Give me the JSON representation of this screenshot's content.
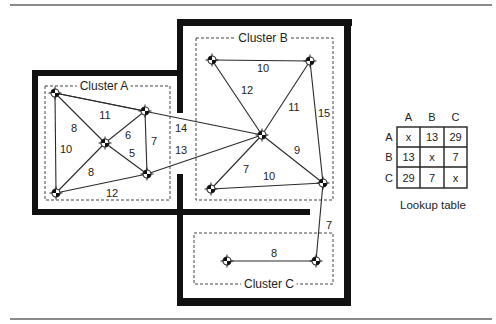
{
  "clusters": [
    {
      "id": "A",
      "label": "Cluster A"
    },
    {
      "id": "B",
      "label": "Cluster B"
    },
    {
      "id": "C",
      "label": "Cluster C"
    }
  ],
  "nodes": [
    "A1",
    "A2",
    "A3",
    "A4",
    "A5",
    "B1",
    "B2",
    "B3",
    "B4",
    "B5",
    "C1",
    "C2"
  ],
  "edges": [
    {
      "from": "A1",
      "to": "A2",
      "weight": "8"
    },
    {
      "from": "A1",
      "to": "A3",
      "weight": "11"
    },
    {
      "from": "A1",
      "to": "A4",
      "weight": "10"
    },
    {
      "from": "A2",
      "to": "A3",
      "weight": "6"
    },
    {
      "from": "A2",
      "to": "A5",
      "weight": "5"
    },
    {
      "from": "A2",
      "to": "A4",
      "weight": "8"
    },
    {
      "from": "A3",
      "to": "A5",
      "weight": "7"
    },
    {
      "from": "A4",
      "to": "A5",
      "weight": "12"
    },
    {
      "from": "A1",
      "to": "B3",
      "weight": "14"
    },
    {
      "from": "A5",
      "to": "B3",
      "weight": "13"
    },
    {
      "from": "B1",
      "to": "B2",
      "weight": "10"
    },
    {
      "from": "B1",
      "to": "B3",
      "weight": "12"
    },
    {
      "from": "B2",
      "to": "B3",
      "weight": "11"
    },
    {
      "from": "B2",
      "to": "B5",
      "weight": "15"
    },
    {
      "from": "B3",
      "to": "B5",
      "weight": "9"
    },
    {
      "from": "B3",
      "to": "B4",
      "weight": "7"
    },
    {
      "from": "B4",
      "to": "B5",
      "weight": "10"
    },
    {
      "from": "B5",
      "to": "C2",
      "weight": "7"
    },
    {
      "from": "C1",
      "to": "C2",
      "weight": "8"
    }
  ],
  "lookup_table": {
    "caption": "Lookup table",
    "col_headers": [
      "A",
      "B",
      "C"
    ],
    "row_headers": [
      "A",
      "B",
      "C"
    ],
    "rows": [
      [
        "x",
        "13",
        "29"
      ],
      [
        "13",
        "x",
        "7"
      ],
      [
        "29",
        "7",
        "x"
      ]
    ]
  }
}
